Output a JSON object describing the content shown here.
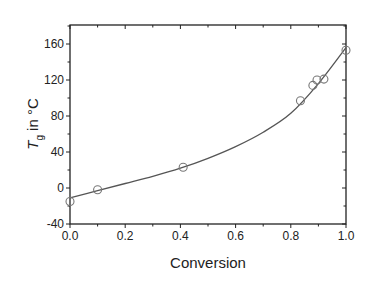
{
  "chart_data": {
    "type": "scatter",
    "title": "",
    "xlabel": "Conversion",
    "ylabel": "T_g in °C",
    "ylabel_parts": {
      "main": "T",
      "sub": "g",
      "rest": " in °C"
    },
    "xlim": [
      0.0,
      1.0
    ],
    "ylim": [
      -40,
      180
    ],
    "x_ticks": [
      0.0,
      0.2,
      0.4,
      0.6,
      0.8,
      1.0
    ],
    "x_tick_labels": [
      "0.0",
      "0.2",
      "0.4",
      "0.6",
      "0.8",
      "1.0"
    ],
    "y_ticks": [
      -40,
      0,
      40,
      80,
      120,
      160
    ],
    "y_tick_labels": [
      "-40",
      "0",
      "40",
      "80",
      "120",
      "160"
    ],
    "grid": false,
    "legend": null,
    "series": [
      {
        "name": "measured",
        "style": "open-circle",
        "x": [
          0.0,
          0.1,
          0.41,
          0.835,
          0.88,
          0.895,
          0.92,
          1.0
        ],
        "y": [
          -15,
          -2,
          23,
          97,
          114,
          120,
          121,
          153
        ]
      },
      {
        "name": "fit",
        "style": "line",
        "x": [
          0.0,
          0.1,
          0.2,
          0.3,
          0.4,
          0.5,
          0.6,
          0.7,
          0.8,
          0.9,
          1.0
        ],
        "y": [
          -11,
          -3,
          5,
          13,
          22,
          33,
          46,
          62,
          83,
          116,
          156
        ]
      }
    ]
  }
}
